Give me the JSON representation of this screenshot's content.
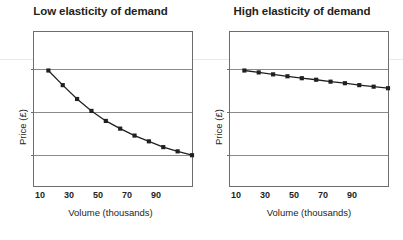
{
  "figure": {
    "panels": [
      {
        "id": "low",
        "title": "Low elasticity of demand",
        "xlabel": "Volume (thousands)",
        "ylabel": "Price (£)"
      },
      {
        "id": "high",
        "title": "High elasticity of demand",
        "xlabel": "Volume (thousands)",
        "ylabel": "Price (£)"
      }
    ],
    "xticks": [
      "10",
      "30",
      "50",
      "70",
      "90"
    ],
    "colors": {
      "line": "#231f20",
      "marker": "#231f20",
      "frame": "#6d6d6d",
      "gridline": "#8a8a8a",
      "title": "#231f20",
      "background": "#ffffff"
    }
  },
  "chart_data": [
    {
      "type": "line",
      "title": "Low elasticity of demand",
      "xlabel": "Volume (thousands)",
      "ylabel": "Price (£)",
      "xlim": [
        0,
        110
      ],
      "ylim": [
        0,
        4
      ],
      "xticks": [
        10,
        30,
        50,
        70,
        90
      ],
      "yticks": [
        1,
        2,
        3
      ],
      "grid": "horizontal",
      "legend": "none",
      "markers": "filled-square",
      "x": [
        10,
        20,
        30,
        40,
        50,
        60,
        70,
        80,
        90,
        100,
        110
      ],
      "y": [
        3.0,
        2.62,
        2.26,
        1.95,
        1.69,
        1.49,
        1.31,
        1.16,
        1.01,
        0.9,
        0.8
      ],
      "series": [
        {
          "name": "Demand curve (low elasticity)",
          "values": [
            3.0,
            2.62,
            2.26,
            1.95,
            1.69,
            1.49,
            1.31,
            1.16,
            1.01,
            0.9,
            0.8
          ]
        }
      ]
    },
    {
      "type": "line",
      "title": "High elasticity of demand",
      "xlabel": "Volume (thousands)",
      "ylabel": "Price (£)",
      "xlim": [
        0,
        110
      ],
      "ylim": [
        0,
        4
      ],
      "xticks": [
        10,
        30,
        50,
        70,
        90
      ],
      "yticks": [
        1,
        2,
        3
      ],
      "grid": "horizontal",
      "legend": "none",
      "markers": "filled-square",
      "x": [
        10,
        20,
        30,
        40,
        50,
        60,
        70,
        80,
        90,
        100,
        110
      ],
      "y": [
        3.0,
        2.95,
        2.9,
        2.85,
        2.8,
        2.76,
        2.71,
        2.67,
        2.62,
        2.58,
        2.54
      ],
      "series": [
        {
          "name": "Demand curve (high elasticity)",
          "values": [
            3.0,
            2.95,
            2.9,
            2.85,
            2.8,
            2.76,
            2.71,
            2.67,
            2.62,
            2.58,
            2.54
          ]
        }
      ]
    }
  ]
}
